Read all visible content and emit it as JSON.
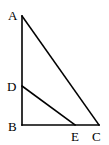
{
  "diagram": {
    "type": "geometry",
    "points": {
      "A": {
        "label": "A",
        "x": 22,
        "y": 16
      },
      "D": {
        "label": "D",
        "x": 22,
        "y": 86
      },
      "B": {
        "label": "B",
        "x": 22,
        "y": 125
      },
      "E": {
        "label": "E",
        "x": 75,
        "y": 125
      },
      "C": {
        "label": "C",
        "x": 99,
        "y": 125
      }
    },
    "segments": [
      "AB",
      "BC",
      "AC",
      "DE"
    ],
    "line_color": "#000000"
  }
}
